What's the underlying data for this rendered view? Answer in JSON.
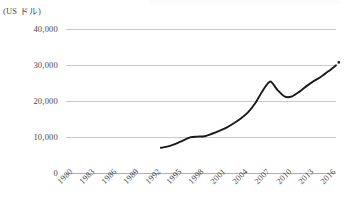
{
  "chart_data": {
    "type": "line",
    "title": "",
    "xlabel": "",
    "ylabel": "(US ドル)",
    "ylim": [
      0,
      40000
    ],
    "xlim": [
      1980,
      2017
    ],
    "grid": true,
    "legend": false,
    "y_ticks": [
      "0",
      "10,000",
      "20,000",
      "30,000",
      "40,000"
    ],
    "y_tick_values": [
      0,
      10000,
      20000,
      30000,
      40000
    ],
    "x_ticks": [
      "1980",
      "1983",
      "1986",
      "1989",
      "1992",
      "1995",
      "1998",
      "2001",
      "2004",
      "2007",
      "2010",
      "2013",
      "2016"
    ],
    "x_tick_values": [
      1980,
      1983,
      1986,
      1989,
      1992,
      1995,
      1998,
      2001,
      2004,
      2007,
      2010,
      2013,
      2016
    ],
    "series": [
      {
        "name": "",
        "color": "#1a1a1a",
        "x": [
          1993,
          1994,
          1995,
          1996,
          1997,
          1998,
          1999,
          2000,
          2001,
          2002,
          2003,
          2004,
          2005,
          2006,
          2007,
          2008,
          2009,
          2010,
          2011,
          2012,
          2013,
          2014,
          2015,
          2016,
          2017
        ],
        "values": [
          7000,
          7400,
          8100,
          9000,
          9900,
          10100,
          10200,
          10900,
          11700,
          12600,
          13800,
          15200,
          17000,
          19600,
          23000,
          25400,
          23000,
          21200,
          21300,
          22600,
          24200,
          25600,
          26800,
          28300,
          29900
        ]
      }
    ],
    "end_marker": {
      "x": 2017,
      "y": 29900,
      "visible": true
    }
  },
  "colors": {
    "line": "#1a1a1a",
    "grid": "#c9c9c9",
    "axis": "#b0b0b0",
    "text": "#4a4a4a",
    "background": "#ffffff"
  }
}
